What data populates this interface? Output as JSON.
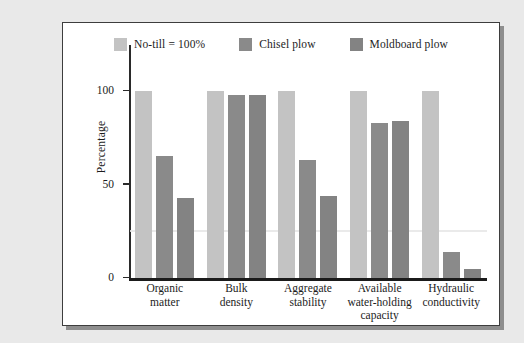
{
  "figure": {
    "background_color": "#e9e9e9",
    "panel_color": "#ffffff",
    "border_color": "#3d3d3d"
  },
  "legend": {
    "position": "top-center",
    "items": [
      {
        "label": "No-till = 100%",
        "color": "#c3c3c3"
      },
      {
        "label": "Chisel plow",
        "color": "#8a8a8a"
      },
      {
        "label": "Moldboard plow",
        "color": "#838383"
      }
    ]
  },
  "axes": {
    "ylabel": "Percentage",
    "xlabel": "",
    "yticks": [
      0,
      50,
      100
    ],
    "ytick_labels": [
      "0",
      "50",
      "100"
    ],
    "ylim": [
      0,
      115
    ],
    "grid": false
  },
  "chart_data": {
    "type": "bar",
    "title": "",
    "xlabel": "",
    "ylabel": "Percentage",
    "ylim": [
      0,
      115
    ],
    "yticks": [
      0,
      50,
      100
    ],
    "grid": false,
    "legend_position": "top-center",
    "categories": [
      "Organic\nmatter",
      "Bulk\ndensity",
      "Aggregate\nstability",
      "Available\nwater-holding\ncapacity",
      "Hydraulic\nconductivity"
    ],
    "series": [
      {
        "name": "No-till = 100%",
        "color": "#c3c3c3",
        "values": [
          100,
          100,
          100,
          100,
          100
        ]
      },
      {
        "name": "Chisel plow",
        "color": "#8a8a8a",
        "values": [
          65,
          98,
          63,
          83,
          14
        ]
      },
      {
        "name": "Moldboard plow",
        "color": "#838383",
        "values": [
          43,
          98,
          44,
          84,
          5
        ]
      }
    ]
  }
}
